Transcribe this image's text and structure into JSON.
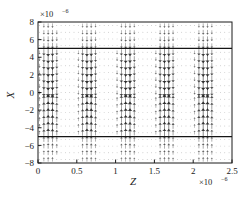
{
  "chart_data": {
    "type": "scatter",
    "plot_kind": "quiver-vector-field",
    "title": "",
    "xlabel": "Z",
    "ylabel": "X",
    "x_exponent_label": "×10",
    "x_exponent_power": "−6",
    "y_exponent_label": "×10",
    "y_exponent_power": "−6",
    "xlim": [
      0,
      2.5
    ],
    "ylim": [
      -8,
      8
    ],
    "xticks": [
      0,
      0.5,
      1,
      1.5,
      2,
      2.5
    ],
    "xtick_labels": [
      "0",
      "0.5",
      "1",
      "1.5",
      "2",
      "2.5"
    ],
    "yticks": [
      8,
      6,
      4,
      2,
      0,
      -2,
      -4,
      -6,
      -8
    ],
    "ytick_labels": [
      "8",
      "6",
      "4",
      "2",
      "0",
      "−2",
      "−4",
      "−6",
      "−8"
    ],
    "grid": false,
    "legend": null,
    "reference_lines": [
      {
        "orientation": "horizontal",
        "y": 5,
        "label": "core-upper-boundary"
      },
      {
        "orientation": "horizontal",
        "y": -5,
        "label": "core-lower-boundary"
      }
    ],
    "field": {
      "description": "Arrow glyph lattice showing a transverse field with periodic longitudinal beating",
      "n_cols": 45,
      "n_rows": 21,
      "x_start": 0.02,
      "x_step": 0.0555,
      "y_start": -7.6,
      "y_step": 0.76,
      "beat_period_z": 0.5,
      "marker": "arrow",
      "color": "#2b2b2b"
    }
  },
  "axes": {
    "box_color": "#1a1a1a",
    "background": "#ffffff"
  }
}
